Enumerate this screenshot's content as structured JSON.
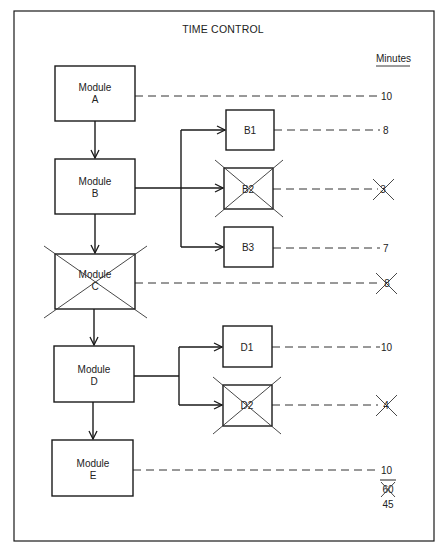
{
  "title": "TIME CONTROL",
  "units_header": "Minutes",
  "modules": [
    {
      "id": "A",
      "line1": "Module",
      "line2": "A",
      "minutes": "10",
      "crossed_out": false
    },
    {
      "id": "B",
      "line1": "Module",
      "line2": "B",
      "minutes": "",
      "crossed_out": false
    },
    {
      "id": "C",
      "line1": "Module",
      "line2": "C",
      "minutes": "8",
      "crossed_out": true
    },
    {
      "id": "D",
      "line1": "Module",
      "line2": "D",
      "minutes": "",
      "crossed_out": false
    },
    {
      "id": "E",
      "line1": "Module",
      "line2": "E",
      "minutes": "10",
      "crossed_out": false
    }
  ],
  "submodules": [
    {
      "id": "B1",
      "label": "B1",
      "parent": "B",
      "minutes": "8",
      "crossed_out": false
    },
    {
      "id": "B2",
      "label": "B2",
      "parent": "B",
      "minutes": "3",
      "crossed_out": true
    },
    {
      "id": "B3",
      "label": "B3",
      "parent": "B",
      "minutes": "7",
      "crossed_out": false
    },
    {
      "id": "D1",
      "label": "D1",
      "parent": "D",
      "minutes": "10",
      "crossed_out": false
    },
    {
      "id": "D2",
      "label": "D2",
      "parent": "D",
      "minutes": "4",
      "crossed_out": true
    }
  ],
  "total": {
    "original": "60",
    "original_crossed_out": true,
    "revised": "45"
  }
}
